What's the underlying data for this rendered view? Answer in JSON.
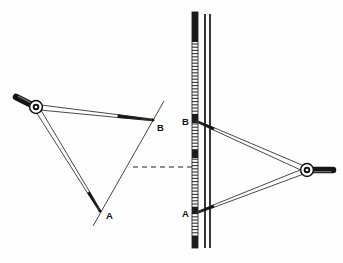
{
  "figure": {
    "background_color": "#fefefe",
    "ink_color": "#111111",
    "width": 343,
    "height": 263
  },
  "left_diagram": {
    "name": "divider-on-drawing",
    "pivot": {
      "x": 36,
      "y": 107
    },
    "handle": {
      "from": {
        "x": 36,
        "y": 107
      },
      "to": {
        "x": 16,
        "y": 97
      },
      "color": "#1a1a1a"
    },
    "points": [
      {
        "id": "A",
        "label": "A",
        "x": 100,
        "y": 211,
        "label_x": 106,
        "label_y": 219
      },
      {
        "id": "B",
        "label": "B",
        "x": 153,
        "y": 120,
        "label_x": 157,
        "label_y": 131
      }
    ],
    "guide_line": {
      "name": "construction-line",
      "from": {
        "x": 164,
        "y": 101
      },
      "to": {
        "x": 93,
        "y": 226
      }
    }
  },
  "center": {
    "dashed_line": {
      "name": "transfer-dashed-line",
      "from": {
        "x": 133,
        "y": 167
      },
      "to": {
        "x": 196,
        "y": 167
      },
      "dash_pattern": "5,4"
    }
  },
  "right_diagram": {
    "name": "divider-on-scale",
    "pivot": {
      "x": 307,
      "y": 170
    },
    "handle": {
      "from": {
        "x": 307,
        "y": 170
      },
      "to": {
        "x": 333,
        "y": 170
      },
      "color": "#1a1a1a"
    },
    "points": [
      {
        "id": "A",
        "label": "A",
        "x": 196,
        "y": 213,
        "label_x": 182,
        "label_y": 217
      },
      {
        "id": "B",
        "label": "B",
        "x": 196,
        "y": 121,
        "label_x": 182,
        "label_y": 125
      }
    ],
    "scale": {
      "name": "graduated-scale",
      "x": 192,
      "y_top": 12,
      "y_bottom": 248,
      "width": 6,
      "tick_spacing": 3.2,
      "tick_color": "#333333",
      "highlight_bands": [
        {
          "y": 12,
          "height": 30,
          "color": "#1c1c1c"
        },
        {
          "y": 114,
          "height": 9,
          "color": "#1c1c1c"
        },
        {
          "y": 150,
          "height": 8,
          "color": "#1c1c1c"
        },
        {
          "y": 207,
          "height": 7,
          "color": "#1c1c1c"
        },
        {
          "y": 236,
          "height": 12,
          "color": "#1c1c1c"
        }
      ]
    },
    "straightedge": {
      "name": "straightedge",
      "line_1_x": 205,
      "line_2_x": 210,
      "y_top": 14,
      "y_bottom": 248
    }
  }
}
